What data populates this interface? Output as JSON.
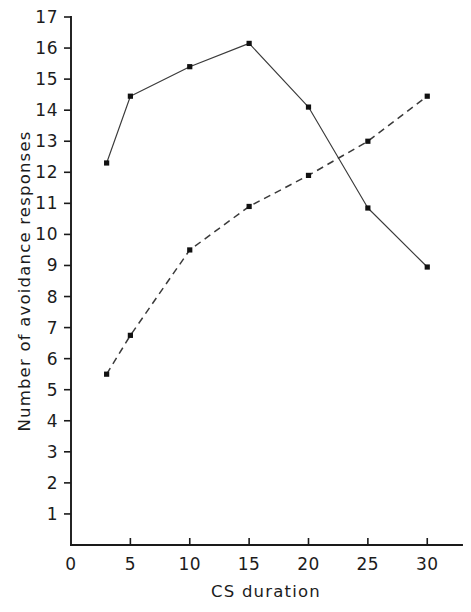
{
  "chart_data": {
    "type": "line",
    "title": "",
    "xlabel": "CS  duration",
    "ylabel": "Number of avoidance responses",
    "xlim": [
      0,
      32
    ],
    "ylim": [
      0,
      17
    ],
    "grid": false,
    "legend": "none",
    "x": [
      3,
      5,
      10,
      15,
      20,
      25,
      30
    ],
    "xticks": [
      0,
      5,
      10,
      15,
      20,
      25,
      30
    ],
    "xtick_labels": [
      "0",
      "5",
      "10",
      "15",
      "20",
      "25",
      "30"
    ],
    "yticks": [
      1,
      2,
      3,
      4,
      5,
      6,
      7,
      8,
      9,
      10,
      11,
      12,
      13,
      14,
      15,
      16,
      17
    ],
    "ytick_labels": [
      "1",
      "2",
      "3",
      "4",
      "5",
      "6",
      "7",
      "8",
      "9",
      "10",
      "11",
      "12",
      "13",
      "14",
      "15",
      "16",
      "17"
    ],
    "series": [
      {
        "name": "solid-series",
        "style": "solid",
        "marker": "filled-square",
        "color": "#3a3a3a",
        "values": [
          12.3,
          14.45,
          15.4,
          16.15,
          14.1,
          10.85,
          8.95
        ]
      },
      {
        "name": "dashed-series",
        "style": "dashed",
        "marker": "filled-square",
        "color": "#3a3a3a",
        "values": [
          5.5,
          6.75,
          9.5,
          10.9,
          11.9,
          13.0,
          14.45
        ]
      }
    ]
  },
  "figure": {
    "background_color": "#ffffff",
    "axis_color": "#1a1a1a"
  }
}
